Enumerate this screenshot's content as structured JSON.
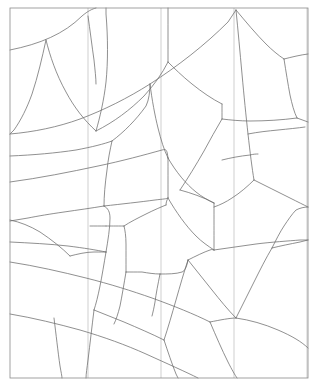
{
  "figure": {
    "type": "line-art",
    "background_color": "#ffffff",
    "line_color": "#6b6b6b",
    "frame_color": "#8a8a8a",
    "guide_color": "#c9c9c9",
    "canvas": {
      "width": 319,
      "height": 392
    }
  },
  "frame": {
    "label": "outer-frame",
    "x": 10,
    "y": 8,
    "width": 298,
    "height": 370
  },
  "guides": [
    {
      "label": "guide-1",
      "x": 88,
      "y1": 8,
      "y2": 378
    },
    {
      "label": "guide-2",
      "x": 161,
      "y1": 8,
      "y2": 378
    },
    {
      "label": "guide-3",
      "x": 234,
      "y1": 8,
      "y2": 378
    },
    {
      "label": "guide-4",
      "x": 307,
      "y1": 8,
      "y2": 378
    }
  ],
  "edges": [
    {
      "label": "edge-01",
      "d": "M 10 50 C 40 44 64 34 82 16 C 88 11 92 9 96 8"
    },
    {
      "label": "edge-02",
      "d": "M 46 40 C 50 56 56 74 66 92 C 74 107 84 120 96 131"
    },
    {
      "label": "edge-03",
      "d": "M 46 40 C 42 58 38 76 32 94 C 27 108 21 120 14 130 L 10 134"
    },
    {
      "label": "edge-04",
      "d": "M 96 131 C 100 117 104 100 106 82 C 108 62 108 38 106 14 L 106 8"
    },
    {
      "label": "edge-05",
      "d": "M 96 131 C 114 122 130 110 144 96 C 154 85 162 74 168 62"
    },
    {
      "label": "edge-06",
      "d": "M 168 62 C 168 46 168 28 168 12 L 168 8"
    },
    {
      "label": "edge-07",
      "d": "M 168 62 C 174 68 182 76 192 84 C 202 92 212 99 222 104"
    },
    {
      "label": "edge-08",
      "d": "M 10 134 C 34 132 58 127 80 119 C 104 110 128 98 150 84 C 178 66 205 45 228 22 L 236 10"
    },
    {
      "label": "edge-09",
      "d": "M 236 10 C 246 22 256 34 266 44 C 272 50 278 55 284 59"
    },
    {
      "label": "edge-10",
      "d": "M 284 59 C 292 57 300 55 308 54"
    },
    {
      "label": "edge-11",
      "d": "M 284 59 C 286 72 288 84 290 95 C 292 104 294 112 297 118"
    },
    {
      "label": "edge-12",
      "d": "M 297 118 L 308 122"
    },
    {
      "label": "edge-13",
      "d": "M 297 118 C 282 120 266 121 250 121 C 240 121 230 120 222 119"
    },
    {
      "label": "edge-14",
      "d": "M 222 104 C 222 110 222 115 222 119"
    },
    {
      "label": "edge-15",
      "d": "M 236 10 C 238 30 240 52 242 74 C 244 96 246 116 248 134 C 250 152 252 168 254 180"
    },
    {
      "label": "edge-16",
      "d": "M 222 119 C 216 129 210 140 204 151 C 196 165 188 178 180 190"
    },
    {
      "label": "edge-17",
      "d": "M 150 84 C 152 100 155 116 158 128 C 161 140 164 150 168 158"
    },
    {
      "label": "edge-18",
      "d": "M 168 158 C 176 172 186 184 196 192 C 202 197 208 200 214 203"
    },
    {
      "label": "edge-19",
      "d": "M 180 190 C 191 193 203 197 214 203"
    },
    {
      "label": "edge-20",
      "d": "M 10 182 C 40 178 70 172 98 166 C 122 161 144 155 162 150 C 166 149 167 149 168 158"
    },
    {
      "label": "edge-21",
      "d": "M 10 156 C 34 155 56 153 76 150 C 92 147 104 144 112 141"
    },
    {
      "label": "edge-22",
      "d": "M 112 141 C 124 132 136 120 146 106 C 149 100 150 91 150 84"
    },
    {
      "label": "edge-23",
      "d": "M 112 141 C 110 150 108 160 107 170 C 105 184 104 196 104 206"
    },
    {
      "label": "edge-24",
      "d": "M 104 206 C 92 208 78 210 64 212 C 50 214 38 216 28 218 L 10 221"
    },
    {
      "label": "edge-25",
      "d": "M 104 206 C 122 204 140 202 155 200 C 163 199 167 199 168 198"
    },
    {
      "label": "edge-26",
      "d": "M 168 158 C 168 170 168 182 168 192 C 168 195 168 197 168 198"
    },
    {
      "label": "edge-27",
      "d": "M 168 198 C 176 212 186 226 196 236 C 202 242 208 246 214 250"
    },
    {
      "label": "edge-28",
      "d": "M 214 203 C 214 218 214 234 214 244 C 214 247 214 249 214 250"
    },
    {
      "label": "edge-29",
      "d": "M 254 180 C 248 186 240 193 232 198 C 226 202 220 205 214 207"
    },
    {
      "label": "edge-30",
      "d": "M 254 180 C 266 186 278 192 290 198 C 298 202 304 205 308 207"
    },
    {
      "label": "edge-31",
      "d": "M 214 250 C 228 248 242 246 256 244 C 272 242 288 241 300 240 L 308 240"
    },
    {
      "label": "edge-32",
      "d": "M 10 242 C 30 243 50 244 68 246 C 84 248 96 250 106 252"
    },
    {
      "label": "edge-33",
      "d": "M 106 252 C 104 264 102 276 100 286 C 98 296 96 304 94 310"
    },
    {
      "label": "edge-34",
      "d": "M 106 252 C 108 240 110 228 110 218 C 110 212 108 208 104 206"
    },
    {
      "label": "edge-35",
      "d": "M 10 262 C 36 266 62 272 86 278 C 110 284 132 291 152 298 C 174 306 194 314 210 322"
    },
    {
      "label": "edge-36",
      "d": "M 94 310 C 104 314 114 318 124 322 C 138 328 152 334 164 340"
    },
    {
      "label": "edge-37",
      "d": "M 164 340 C 168 328 172 314 176 300 C 180 286 184 272 188 260"
    },
    {
      "label": "edge-38",
      "d": "M 188 260 C 196 270 204 280 212 290 C 220 300 228 310 236 318"
    },
    {
      "label": "edge-39",
      "d": "M 188 260 C 196 256 204 252 210 250 C 212 249 213 250 214 250"
    },
    {
      "label": "edge-40",
      "d": "M 210 322 C 220 320 230 318 236 318"
    },
    {
      "label": "edge-41",
      "d": "M 236 318 C 250 320 264 324 278 330 C 292 336 302 342 308 348"
    },
    {
      "label": "edge-42",
      "d": "M 236 318 C 242 306 248 294 254 282 C 260 270 266 258 272 248"
    },
    {
      "label": "edge-43",
      "d": "M 272 248 C 280 246 290 244 300 242 L 308 240"
    },
    {
      "label": "edge-44",
      "d": "M 272 248 C 276 240 280 232 284 226 C 288 220 292 214 296 210 C 300 208 304 207 308 207"
    },
    {
      "label": "edge-45",
      "d": "M 164 340 C 168 352 172 364 176 374 L 178 378"
    },
    {
      "label": "edge-46",
      "d": "M 94 310 C 92 326 90 344 88 360 C 87 368 86 374 86 378"
    },
    {
      "label": "edge-47",
      "d": "M 210 322 C 216 336 222 350 228 362 C 232 370 235 375 237 378"
    },
    {
      "label": "edge-48",
      "d": "M 10 314 C 34 318 58 324 80 330 C 104 337 126 345 146 354 C 168 364 186 372 198 378"
    },
    {
      "label": "edge-49",
      "d": "M 160 274 C 168 274 176 274 182 272 C 185 271 187 266 188 260"
    },
    {
      "label": "edge-50",
      "d": "M 160 274 C 158 284 156 294 155 302 C 154 308 153 312 152 316"
    },
    {
      "label": "edge-51",
      "d": "M 160 274 C 154 274 148 273 142 272 C 136 272 130 272 126 272"
    },
    {
      "label": "edge-52",
      "d": "M 126 272 C 124 284 122 296 120 306 C 118 314 116 320 114 324"
    },
    {
      "label": "edge-53",
      "d": "M 126 272 C 126 262 126 252 126 244 C 126 236 125 230 124 226"
    },
    {
      "label": "edge-54",
      "d": "M 124 226 C 130 222 138 218 146 214 C 154 210 161 207 166 205"
    },
    {
      "label": "edge-55",
      "d": "M 124 226 C 116 226 110 226 106 226"
    },
    {
      "label": "edge-56",
      "d": "M 166 205 C 166 202 167 200 168 198"
    },
    {
      "label": "edge-57",
      "d": "M 106 226 C 100 226 94 226 90 226"
    },
    {
      "label": "edge-58",
      "d": "M 10 220 C 20 222 30 226 40 232 C 52 240 62 248 70 256"
    },
    {
      "label": "edge-59",
      "d": "M 70 256 C 78 254 86 252 94 252 C 100 252 104 252 106 252"
    },
    {
      "label": "edge-60",
      "d": "M 54 318 C 56 334 58 352 60 366 C 61 372 62 376 62 378"
    },
    {
      "label": "edge-61",
      "d": "M 222 160 C 230 158 240 156 250 155 C 254 154 256 154 258 154"
    },
    {
      "label": "edge-62",
      "d": "M 248 134 C 258 132 268 131 278 130 C 288 129 298 128 305 127"
    },
    {
      "label": "edge-63",
      "d": "M 88 16 C 90 30 92 46 94 60 C 95 70 96 78 96 84"
    }
  ]
}
